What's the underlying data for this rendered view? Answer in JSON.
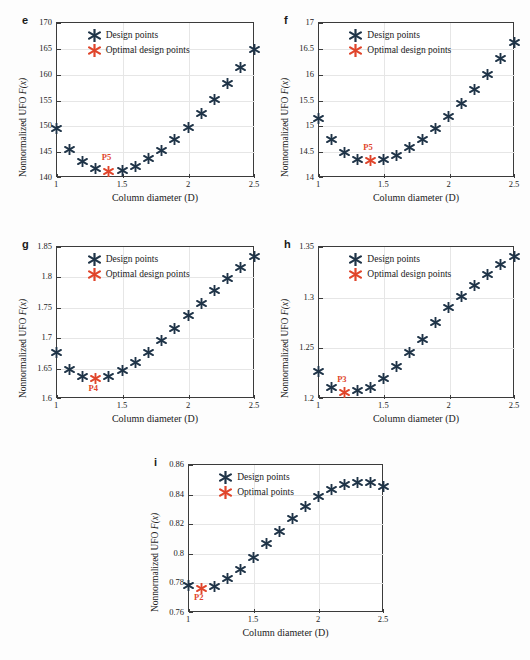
{
  "figure": {
    "background": "#fdfdfd",
    "design_color": "#1f3448",
    "optimal_color": "#e0452b",
    "axis_color": "#3b3b3b",
    "grid_color": "#e6e6e6"
  },
  "legend_labels": {
    "design": "Design points",
    "optimal_design": "Optimal design points",
    "optimal": "Optimal points"
  },
  "common": {
    "xlabel": "Column diameter (D)",
    "ylabel_prefix": "Nonnormalized UFO ",
    "ylabel_math": "F(x)",
    "xticks": [
      "1",
      "1.5",
      "2",
      "2.5"
    ]
  },
  "chart_data": [
    {
      "id": "e",
      "panel_letter": "e",
      "type": "scatter",
      "title": "",
      "xlabel": "Column diameter (D)",
      "ylabel": "Nonnormalized UFO F(x)",
      "xlim": [
        1,
        2.5
      ],
      "ylim": [
        140,
        170
      ],
      "xticks": [
        1,
        1.5,
        2,
        2.5
      ],
      "yticks": [
        140,
        145,
        150,
        155,
        160,
        165,
        170
      ],
      "grid": true,
      "legend": [
        "Design points",
        "Optimal design points"
      ],
      "legend_position": "top-left",
      "series": [
        {
          "name": "Design points",
          "color": "#1f3448",
          "x": [
            1.0,
            1.1,
            1.2,
            1.3,
            1.5,
            1.6,
            1.7,
            1.8,
            1.9,
            2.0,
            2.1,
            2.2,
            2.3,
            2.4,
            2.5
          ],
          "y": [
            150.0,
            146.0,
            143.5,
            142.2,
            141.9,
            142.7,
            144.1,
            145.7,
            147.8,
            150.2,
            152.9,
            155.6,
            158.6,
            161.7,
            165.2
          ]
        },
        {
          "name": "Optimal design points",
          "color": "#e0452b",
          "x": [
            1.4
          ],
          "y": [
            141.7
          ],
          "annotation": "P5"
        }
      ]
    },
    {
      "id": "f",
      "panel_letter": "f",
      "type": "scatter",
      "title": "",
      "xlabel": "Column diameter (D)",
      "ylabel": "Nonnormalized UFO F(x)",
      "xlim": [
        1,
        2.5
      ],
      "ylim": [
        14,
        17
      ],
      "xticks": [
        1,
        1.5,
        2,
        2.5
      ],
      "yticks": [
        14,
        14.5,
        15,
        15.5,
        16,
        16.5,
        17
      ],
      "grid": true,
      "legend": [
        "Design points",
        "Optimal design points"
      ],
      "legend_position": "top-left",
      "series": [
        {
          "name": "Design points",
          "color": "#1f3448",
          "x": [
            1.0,
            1.1,
            1.2,
            1.3,
            1.5,
            1.6,
            1.7,
            1.8,
            1.9,
            2.0,
            2.1,
            2.2,
            2.3,
            2.4,
            2.5
          ],
          "y": [
            15.19,
            14.78,
            14.53,
            14.4,
            14.4,
            14.48,
            14.62,
            14.79,
            15.0,
            15.23,
            15.49,
            15.76,
            16.05,
            16.36,
            16.67
          ]
        },
        {
          "name": "Optimal design points",
          "color": "#e0452b",
          "x": [
            1.4
          ],
          "y": [
            14.37
          ],
          "annotation": "P5"
        }
      ]
    },
    {
      "id": "g",
      "panel_letter": "g",
      "type": "scatter",
      "title": "",
      "xlabel": "Column diameter (D)",
      "ylabel": "Nonnormalized UFO F(x)",
      "xlim": [
        1,
        2.5
      ],
      "ylim": [
        1.6,
        1.85
      ],
      "xticks": [
        1,
        1.5,
        2,
        2.5
      ],
      "yticks": [
        1.6,
        1.65,
        1.7,
        1.75,
        1.8,
        1.85
      ],
      "grid": true,
      "legend": [
        "Design points",
        "Optimal design points"
      ],
      "legend_position": "top-left",
      "series": [
        {
          "name": "Design points",
          "color": "#1f3448",
          "x": [
            1.0,
            1.1,
            1.2,
            1.4,
            1.5,
            1.6,
            1.7,
            1.8,
            1.9,
            2.0,
            2.1,
            2.2,
            2.3,
            2.4,
            2.5
          ],
          "y": [
            1.679,
            1.652,
            1.641,
            1.64,
            1.65,
            1.663,
            1.679,
            1.699,
            1.719,
            1.74,
            1.761,
            1.781,
            1.801,
            1.82,
            1.837
          ]
        },
        {
          "name": "Optimal design points",
          "color": "#e0452b",
          "x": [
            1.3
          ],
          "y": [
            1.637
          ],
          "annotation": "P4"
        }
      ]
    },
    {
      "id": "h",
      "panel_letter": "h",
      "type": "scatter",
      "title": "",
      "xlabel": "Column diameter (D)",
      "ylabel": "Nonnormalized UFO F(x)",
      "xlim": [
        1,
        2.5
      ],
      "ylim": [
        1.2,
        1.35
      ],
      "xticks": [
        1,
        1.5,
        2,
        2.5
      ],
      "yticks": [
        1.2,
        1.25,
        1.3,
        1.35
      ],
      "grid": true,
      "legend": [
        "Design points",
        "Optimal design points"
      ],
      "legend_position": "top-left",
      "series": [
        {
          "name": "Design points",
          "color": "#1f3448",
          "x": [
            1.0,
            1.1,
            1.3,
            1.4,
            1.5,
            1.6,
            1.7,
            1.8,
            1.9,
            2.0,
            2.1,
            2.2,
            2.3,
            2.4,
            2.5
          ],
          "y": [
            1.229,
            1.213,
            1.21,
            1.213,
            1.222,
            1.234,
            1.248,
            1.261,
            1.277,
            1.292,
            1.303,
            1.314,
            1.325,
            1.335,
            1.343
          ]
        },
        {
          "name": "Optimal design points",
          "color": "#e0452b",
          "x": [
            1.2
          ],
          "y": [
            1.208
          ],
          "annotation": "P3"
        }
      ]
    },
    {
      "id": "i",
      "panel_letter": "i",
      "type": "scatter",
      "title": "",
      "xlabel": "Column diameter (D)",
      "ylabel": "Nonnormalized UFO F(x)",
      "xlim": [
        1,
        2.5
      ],
      "ylim": [
        0.76,
        0.86
      ],
      "xticks": [
        1,
        1.5,
        2,
        2.5
      ],
      "yticks": [
        0.76,
        0.78,
        0.8,
        0.82,
        0.84,
        0.86
      ],
      "grid": true,
      "legend": [
        "Design points",
        "Optimal points"
      ],
      "legend_position": "top-left",
      "series": [
        {
          "name": "Design points",
          "color": "#1f3448",
          "x": [
            1.0,
            1.2,
            1.3,
            1.4,
            1.5,
            1.6,
            1.7,
            1.8,
            1.9,
            2.0,
            2.1,
            2.2,
            2.3,
            2.4,
            2.5
          ],
          "y": [
            0.78,
            0.7795,
            0.7845,
            0.791,
            0.799,
            0.808,
            0.8165,
            0.8255,
            0.833,
            0.84,
            0.845,
            0.8485,
            0.8495,
            0.8495,
            0.847
          ]
        },
        {
          "name": "Optimal points",
          "color": "#e0452b",
          "x": [
            1.1
          ],
          "y": [
            0.778
          ],
          "annotation": "P2"
        }
      ]
    }
  ]
}
